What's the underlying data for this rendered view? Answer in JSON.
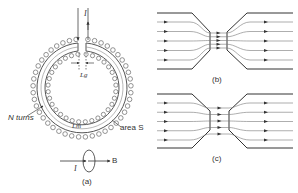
{
  "figure": {
    "panel_a": {
      "current_label": "I",
      "gap_length_label": "Lg",
      "turns_label": "N turns",
      "core_length_label": "Lm",
      "area_label": "area S",
      "field_label": "B",
      "loop_current_label": "I",
      "caption": "(a)"
    },
    "panel_b": {
      "caption": "(b)"
    },
    "panel_c": {
      "caption": "(c)"
    },
    "colors": {
      "line": "#444444",
      "background": "#ffffff"
    }
  }
}
